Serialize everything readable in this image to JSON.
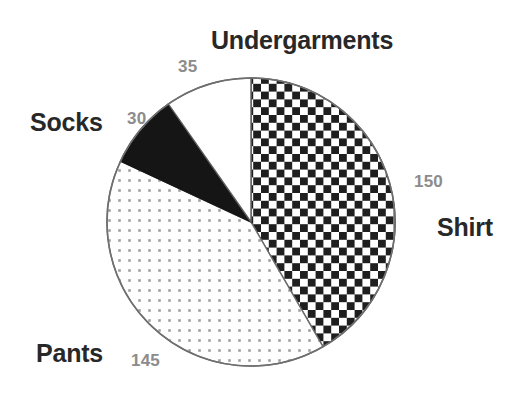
{
  "chart_data": {
    "type": "pie",
    "title": "Undergarments",
    "xlabel": "",
    "ylabel": "",
    "legend_position": "none",
    "grid": false,
    "total": 360,
    "categories": [
      "Shirt",
      "Pants",
      "Socks",
      "Undergarments"
    ],
    "values": [
      150,
      145,
      30,
      35
    ],
    "labels": {
      "shirt": "Shirt",
      "pants": "Pants",
      "socks": "Socks",
      "undergarments": "Undergarments"
    },
    "value_labels": {
      "shirt": "150",
      "pants": "145",
      "socks": "30",
      "undergarments": "35"
    },
    "slices": [
      {
        "name": "Shirt",
        "value": 150,
        "value_label": "150",
        "start_angle_deg": 0,
        "sweep_deg": 150,
        "fill": "checkerboard",
        "fill_color": "#1a1a1a"
      },
      {
        "name": "Pants",
        "value": 145,
        "value_label": "145",
        "start_angle_deg": 150,
        "sweep_deg": 145,
        "fill": "dotted",
        "fill_color": "#9a9a9a"
      },
      {
        "name": "Socks",
        "value": 30,
        "value_label": "30",
        "start_angle_deg": 295,
        "sweep_deg": 30,
        "fill": "solid-black",
        "fill_color": "#101010"
      },
      {
        "name": "Undergarments",
        "value": 35,
        "value_label": "35",
        "start_angle_deg": 325,
        "sweep_deg": 35,
        "fill": "white",
        "fill_color": "#ffffff"
      }
    ],
    "colors": {
      "background": "#ffffff",
      "outline": "#5a5a5a",
      "category_text": "#242424",
      "value_text": "#8a8a8a"
    }
  }
}
